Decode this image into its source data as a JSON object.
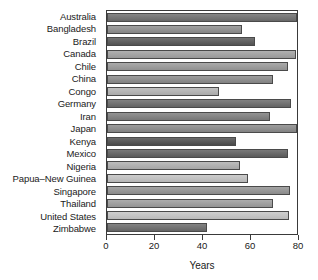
{
  "chart_data": {
    "type": "bar",
    "orientation": "horizontal",
    "title": "",
    "xlabel": "Years",
    "ylabel": "",
    "xlim": [
      0,
      80
    ],
    "xticks": [
      0,
      20,
      40,
      60,
      80
    ],
    "grid": false,
    "legend": "none",
    "categories": [
      "Australia",
      "Bangladesh",
      "Brazil",
      "Canada",
      "Chile",
      "Chile",
      "China",
      "Congo",
      "Germany",
      "Iran",
      "Japan",
      "Kenya",
      "Mexico",
      "Nigeria",
      "Papua–New Guinea",
      "Singapore",
      "Thailand",
      "United States",
      "Zimbabwe"
    ],
    "bars": [
      {
        "label": "Australia",
        "value": 80.0,
        "color": "#6e6e6e"
      },
      {
        "label": "Bangladesh",
        "value": 57.0,
        "color": "#8e8e8e"
      },
      {
        "label": "Brazil",
        "value": 62.5,
        "color": "#575757"
      },
      {
        "label": "Canada",
        "value": 79.5,
        "color": "#a2a2a2"
      },
      {
        "label": "Chile",
        "value": 76.0,
        "color": "#9a9a9a"
      },
      {
        "label": "China",
        "value": 70.0,
        "color": "#8a8a8a"
      },
      {
        "label": "Congo",
        "value": 47.0,
        "color": "#b4b4b4"
      },
      {
        "label": "Germany",
        "value": 77.5,
        "color": "#6a6a6a"
      },
      {
        "label": "Iran",
        "value": 68.5,
        "color": "#7e7e7e"
      },
      {
        "label": "Japan",
        "value": 80.0,
        "color": "#8a8a8a"
      },
      {
        "label": "Kenya",
        "value": 54.5,
        "color": "#4e4e4e"
      },
      {
        "label": "Mexico",
        "value": 76.0,
        "color": "#5f5f5f"
      },
      {
        "label": "Nigeria",
        "value": 56.0,
        "color": "#b0b0b0"
      },
      {
        "label": "Papua–New Guinea",
        "value": 59.5,
        "color": "#c2c2c2"
      },
      {
        "label": "Singapore",
        "value": 77.0,
        "color": "#939393"
      },
      {
        "label": "Thailand",
        "value": 70.0,
        "color": "#9d9d9d"
      },
      {
        "label": "United States",
        "value": 76.5,
        "color": "#c6c6c6"
      },
      {
        "label": "Zimbabwe",
        "value": 42.0,
        "color": "#6b6b6b"
      }
    ]
  }
}
